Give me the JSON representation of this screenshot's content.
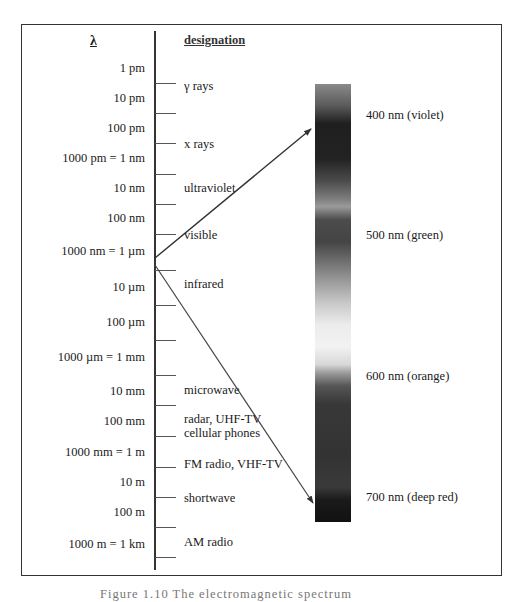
{
  "diagram": {
    "lambda_header": "λ",
    "designation_header": "designation",
    "wavelength_labels": [
      {
        "text": "1 pm",
        "y": 68
      },
      {
        "text": "10 pm",
        "y": 98
      },
      {
        "text": "100 pm",
        "y": 128
      },
      {
        "text": "1000 pm = 1 nm",
        "y": 158
      },
      {
        "text": "10 nm",
        "y": 188
      },
      {
        "text": "100 nm",
        "y": 218
      },
      {
        "text": "1000 nm  = 1 µm",
        "y": 251
      },
      {
        "text": "10 µm",
        "y": 287
      },
      {
        "text": "100 µm",
        "y": 322
      },
      {
        "text": "1000 µm = 1 mm",
        "y": 357
      },
      {
        "text": "10 mm",
        "y": 391
      },
      {
        "text": "100 mm",
        "y": 421
      },
      {
        "text": "1000 mm = 1 m",
        "y": 452
      },
      {
        "text": "10 m",
        "y": 482
      },
      {
        "text": "100 m",
        "y": 512
      },
      {
        "text": "1000 m = 1 km",
        "y": 544
      }
    ],
    "ticks_y": [
      83,
      113,
      143,
      174,
      204,
      234,
      270,
      305,
      340,
      375,
      405,
      436,
      467,
      497,
      527,
      557
    ],
    "designations": [
      {
        "text": "γ rays",
        "y": 86
      },
      {
        "text": "x rays",
        "y": 144
      },
      {
        "text": "ultraviolet",
        "y": 188
      },
      {
        "text": "visible",
        "y": 235
      },
      {
        "text": "infrared",
        "y": 284
      },
      {
        "text": "microwave",
        "y": 390
      },
      {
        "text": "radar, UHF-TV",
        "y": 419
      },
      {
        "text": "cellular phones",
        "y": 433
      },
      {
        "text": "FM radio, VHF-TV",
        "y": 464
      },
      {
        "text": "shortwave",
        "y": 498
      },
      {
        "text": "AM radio",
        "y": 542
      }
    ],
    "spectrum_labels": [
      {
        "text": "400 nm (violet)",
        "y": 115
      },
      {
        "text": "500 nm (green)",
        "y": 235
      },
      {
        "text": "600 nm (orange)",
        "y": 376
      },
      {
        "text": "700 nm (deep red)",
        "y": 497
      }
    ],
    "arrows": {
      "upper": {
        "x1": 155,
        "y1": 258,
        "x2": 311,
        "y2": 129
      },
      "lower": {
        "x1": 155,
        "y1": 265,
        "x2": 313,
        "y2": 503
      }
    },
    "caption": "Figure 1.10   The electromagnetic spectrum"
  }
}
